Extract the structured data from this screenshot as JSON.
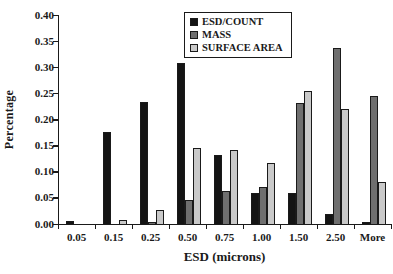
{
  "chart_data": {
    "type": "bar",
    "title": "",
    "xlabel": "ESD (microns)",
    "ylabel": "Percentage",
    "categories": [
      "0.05",
      "0.15",
      "0.25",
      "0.50",
      "0.75",
      "1.00",
      "1.50",
      "2.50",
      "More"
    ],
    "series": [
      {
        "name": "ESD/COUNT",
        "color": "#141414",
        "values": [
          0.005,
          0.177,
          0.233,
          0.309,
          0.133,
          0.06,
          0.059,
          0.019,
          0.003
        ]
      },
      {
        "name": "MASS",
        "color": "#6f6f6f",
        "values": [
          0,
          0,
          0.004,
          0.045,
          0.064,
          0.071,
          0.231,
          0.337,
          0.245
        ]
      },
      {
        "name": "SURFACE AREA",
        "color": "#c9c9c9",
        "values": [
          0,
          0.007,
          0.027,
          0.146,
          0.142,
          0.116,
          0.254,
          0.221,
          0.08
        ]
      }
    ],
    "ylim": [
      0,
      0.4
    ],
    "ytick_step": 0.05,
    "yticks": [
      "0.40",
      "0.35",
      "0.30",
      "0.25",
      "0.20",
      "0.15",
      "0.10",
      "0.05",
      "0.00"
    ],
    "grid": false,
    "legend_position": "top-center",
    "axis_color": "#1a1a1a"
  }
}
